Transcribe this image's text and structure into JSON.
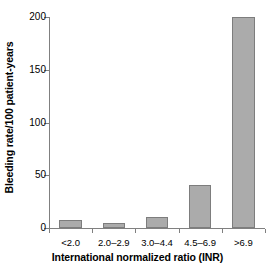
{
  "chart_data": {
    "type": "bar",
    "title": "",
    "xlabel": "International normalized ratio (INR)",
    "ylabel": "Bleeding rate/100 patient-years",
    "categories": [
      "<2.0",
      "2.0–2.9",
      "3.0–4.4",
      "4.5–6.9",
      ">6.9"
    ],
    "values": [
      8,
      5,
      10,
      41,
      200
    ],
    "series": [
      {
        "name": "Bleeding rate/100 patient-years",
        "values": [
          8,
          5,
          10,
          41,
          200
        ]
      }
    ],
    "ylim": [
      0,
      200
    ],
    "yticks": [
      0,
      50,
      100,
      150,
      200
    ],
    "ytick_labels": [
      "0",
      "50",
      "100",
      "150",
      "200"
    ],
    "xlim": [
      0,
      5
    ],
    "grid": false,
    "legend": null,
    "legend_position": "none",
    "bar_color": "#ababab",
    "bar_edge_color": "#7d7d7d",
    "axis_color": "#808080",
    "background": "#ffffff"
  }
}
